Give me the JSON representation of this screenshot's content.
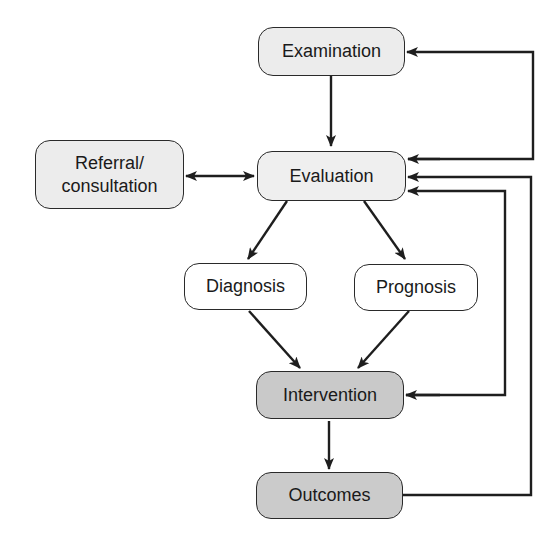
{
  "diagram": {
    "type": "flowchart",
    "nodes": {
      "examination": {
        "label": "Examination",
        "fill": "#ececec"
      },
      "evaluation": {
        "label": "Evaluation",
        "fill": "#efefef"
      },
      "referral": {
        "label": "Referral/\nconsultation",
        "fill": "#ececec"
      },
      "diagnosis": {
        "label": "Diagnosis",
        "fill": "#ffffff"
      },
      "prognosis": {
        "label": "Prognosis",
        "fill": "#ffffff"
      },
      "intervention": {
        "label": "Intervention",
        "fill": "#c9c9c9"
      },
      "outcomes": {
        "label": "Outcomes",
        "fill": "#cbcbcb"
      }
    },
    "edges": [
      {
        "from": "Examination",
        "to": "Evaluation"
      },
      {
        "from": "Referral/consultation",
        "to": "Evaluation",
        "bidirectional": true
      },
      {
        "from": "Evaluation",
        "to": "Diagnosis"
      },
      {
        "from": "Evaluation",
        "to": "Prognosis"
      },
      {
        "from": "Diagnosis",
        "to": "Intervention"
      },
      {
        "from": "Prognosis",
        "to": "Intervention"
      },
      {
        "from": "Intervention",
        "to": "Outcomes"
      },
      {
        "from": "Evaluation",
        "to": "Examination",
        "note": "feedback loop"
      },
      {
        "from": "Intervention",
        "to": "Evaluation",
        "note": "feedback loop"
      },
      {
        "from": "Outcomes",
        "to": "Evaluation",
        "note": "feedback loop"
      }
    ],
    "line_color": "#1e1e1e"
  }
}
